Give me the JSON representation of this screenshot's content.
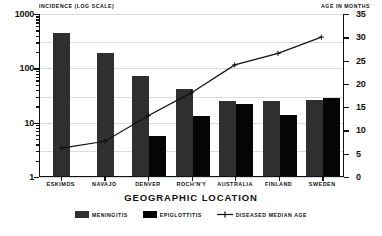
{
  "chart_data": {
    "type": "bar",
    "title": "",
    "xlabel": "GEOGRAPHIC LOCATION",
    "ylabel": "INCIDENCE (LOG SCALE)",
    "y2label": "AGE IN MONTHS",
    "categories": [
      "ESKIMOS",
      "NAVAJO",
      "DENVER",
      "ROCH'N'Y",
      "AUSTRALIA",
      "FINLAND",
      "SWEDEN"
    ],
    "yscale": "log",
    "ylim": [
      1,
      1000
    ],
    "yticks": [
      1,
      10,
      100,
      1000
    ],
    "ytick_labels": [
      "1",
      "10",
      "100",
      "1000"
    ],
    "y2lim": [
      0,
      35
    ],
    "y2ticks": [
      0,
      5,
      10,
      15,
      20,
      25,
      30,
      35
    ],
    "y2tick_labels": [
      "0",
      "5",
      "10",
      "15",
      "20",
      "25",
      "30",
      "35"
    ],
    "grid": true,
    "legend_position": "bottom",
    "series": [
      {
        "name": "MENINGITIS",
        "kind": "bar",
        "axis": "left",
        "color": "#2f2f2f",
        "values": [
          420,
          180,
          70,
          40,
          24,
          24,
          25
        ]
      },
      {
        "name": "EPIGLOTTITIS",
        "kind": "bar",
        "axis": "left",
        "color": "#050505",
        "values": [
          null,
          null,
          5.5,
          12.5,
          21,
          13.5,
          27
        ]
      },
      {
        "name": "DISEASED MEDIAN AGE",
        "kind": "line",
        "axis": "right",
        "color": "#111111",
        "marker": "plus",
        "values": [
          6,
          7.5,
          13,
          18,
          24,
          26.5,
          30
        ]
      }
    ]
  },
  "legend": {
    "items": [
      {
        "label": "MENINGITIS",
        "icon": "filled-square-swatch"
      },
      {
        "label": "EPIGLOTTITIS",
        "icon": "filled-square-swatch"
      },
      {
        "label": "DISEASED MEDIAN AGE",
        "icon": "line-with-plus-marker"
      }
    ]
  }
}
